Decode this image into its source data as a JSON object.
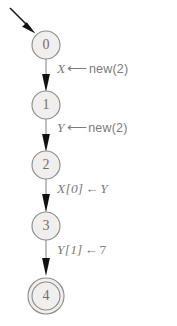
{
  "diagram": {
    "type": "control-flow-graph",
    "title": "",
    "background_color": "#ffffff",
    "node_fill_color": "#f0efee",
    "node_stroke_color": "#8d8d8d",
    "edge_color": "#8a8a8a",
    "arrow_color": "#111111",
    "label_color": "#7b7b7b",
    "entry_arrow": {
      "name": "entry-arrow",
      "from_x": 10,
      "from_y": 8,
      "to_x": 34,
      "to_y": 32,
      "target_node": "0"
    },
    "nodes": [
      {
        "id": "0",
        "label": "0",
        "cx": 46,
        "cy": 45,
        "r": 14,
        "final": false
      },
      {
        "id": "1",
        "label": "1",
        "cx": 46,
        "cy": 105,
        "r": 14,
        "final": false
      },
      {
        "id": "2",
        "label": "2",
        "cx": 46,
        "cy": 165,
        "r": 14,
        "final": false
      },
      {
        "id": "3",
        "label": "3",
        "cx": 46,
        "cy": 226,
        "r": 14,
        "final": false
      },
      {
        "id": "4",
        "label": "4",
        "cx": 46,
        "cy": 296,
        "r": 14,
        "final": true,
        "r_outer": 18
      }
    ],
    "edges": [
      {
        "id": "e0",
        "name": "edge-0-to-1",
        "from": "0",
        "to": "1",
        "x": 46,
        "y1": 59,
        "y2": 91,
        "label": {
          "name": "edge-label-0",
          "text": "X ⟵ new(2)",
          "lhs": "X",
          "operator": "⟵",
          "rhs": "new(2)",
          "x": 57,
          "y": 62
        }
      },
      {
        "id": "e1",
        "name": "edge-1-to-2",
        "from": "1",
        "to": "2",
        "x": 46,
        "y1": 119,
        "y2": 151,
        "label": {
          "name": "edge-label-1",
          "text": "Y ⟵ new(2)",
          "lhs": "Y",
          "operator": "⟵",
          "rhs": "new(2)",
          "x": 57,
          "y": 121
        }
      },
      {
        "id": "e2",
        "name": "edge-2-to-3",
        "from": "2",
        "to": "3",
        "x": 46,
        "y1": 179,
        "y2": 212,
        "label": {
          "name": "edge-label-2",
          "text": "X[0] ← Y",
          "lhs": "X[0]",
          "operator": "←",
          "rhs": "Y",
          "x": 57,
          "y": 182
        }
      },
      {
        "id": "e3",
        "name": "edge-3-to-4",
        "from": "3",
        "to": "4",
        "x": 46,
        "y1": 240,
        "y2": 274,
        "label": {
          "name": "edge-label-3",
          "text": "Y[1] ← 7",
          "lhs": "Y[1]",
          "operator": "←",
          "rhs": "7",
          "x": 57,
          "y": 243
        }
      }
    ]
  }
}
